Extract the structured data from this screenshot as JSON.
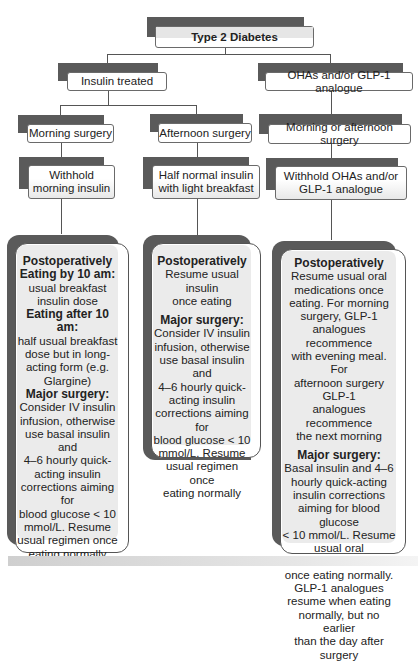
{
  "root": {
    "label": "Type 2 Diabetes"
  },
  "branches": [
    {
      "label": "Insulin treated",
      "children": [
        {
          "timing": "Morning surgery",
          "action": [
            "Withhold",
            "morning insulin"
          ],
          "postop": {
            "lines": [
              {
                "text": "Postoperatively",
                "bold": true
              },
              {
                "text": "Eating by 10 am:",
                "bold": true
              },
              {
                "text": "usual breakfast",
                "bold": false
              },
              {
                "text": "insulin dose",
                "bold": false
              },
              {
                "text": "Eating after 10 am:",
                "bold": true
              },
              {
                "text": "half usual breakfast",
                "bold": false
              },
              {
                "text": "dose but in long-",
                "bold": false
              },
              {
                "text": "acting form (e.g.",
                "bold": false
              },
              {
                "text": "Glargine)",
                "bold": false
              },
              {
                "text": "Major surgery:",
                "bold": true
              },
              {
                "text": "Consider IV insulin",
                "bold": false
              },
              {
                "text": "infusion, otherwise",
                "bold": false
              },
              {
                "text": "use basal insulin and",
                "bold": false
              },
              {
                "text": "4–6 hourly quick-",
                "bold": false
              },
              {
                "text": "acting insulin",
                "bold": false
              },
              {
                "text": "corrections aiming for",
                "bold": false
              },
              {
                "text": "blood glucose < 10",
                "bold": false
              },
              {
                "text": "mmol/L. Resume",
                "bold": false
              },
              {
                "text": "usual regimen once",
                "bold": false
              },
              {
                "text": "eating normally",
                "bold": false
              }
            ]
          }
        },
        {
          "timing": "Afternoon surgery",
          "action": [
            "Half normal insulin",
            "with light breakfast"
          ],
          "postop": {
            "lines": [
              {
                "text": "Postoperatively",
                "bold": true
              },
              {
                "text": "Resume usual insulin",
                "bold": false
              },
              {
                "text": "once eating",
                "bold": false
              },
              {
                "text": "",
                "gap": true
              },
              {
                "text": "Major surgery:",
                "bold": true
              },
              {
                "text": "Consider IV insulin",
                "bold": false
              },
              {
                "text": "infusion, otherwise",
                "bold": false
              },
              {
                "text": "use basal insulin and",
                "bold": false
              },
              {
                "text": "4–6 hourly quick-",
                "bold": false
              },
              {
                "text": "acting insulin",
                "bold": false
              },
              {
                "text": "corrections aiming for",
                "bold": false
              },
              {
                "text": "blood glucose < 10",
                "bold": false
              },
              {
                "text": "mmol/L. Resume",
                "bold": false
              },
              {
                "text": "usual regimen once",
                "bold": false
              },
              {
                "text": "eating normally",
                "bold": false
              }
            ]
          }
        }
      ]
    },
    {
      "label": "OHAs and/or GLP-1 analogue",
      "children": [
        {
          "timing": "Morning or afternoon surgery",
          "action": [
            "Withhold OHAs and/or",
            "GLP-1 analogue"
          ],
          "postop": {
            "lines": [
              {
                "text": "Postoperatively",
                "bold": true
              },
              {
                "text": "Resume usual oral",
                "bold": false
              },
              {
                "text": "medications once",
                "bold": false
              },
              {
                "text": "eating. For morning",
                "bold": false
              },
              {
                "text": "surgery, GLP-1",
                "bold": false
              },
              {
                "text": "analogues recommence",
                "bold": false
              },
              {
                "text": "with evening meal. For",
                "bold": false
              },
              {
                "text": "afternoon surgery GLP-1",
                "bold": false
              },
              {
                "text": "analogues recommence",
                "bold": false
              },
              {
                "text": "the next morning",
                "bold": false
              },
              {
                "text": "",
                "gap": true
              },
              {
                "text": "Major surgery:",
                "bold": true
              },
              {
                "text": "Basal insulin and 4–6",
                "bold": false
              },
              {
                "text": "hourly quick-acting",
                "bold": false
              },
              {
                "text": "insulin corrections",
                "bold": false
              },
              {
                "text": "aiming for blood glucose",
                "bold": false
              },
              {
                "text": "< 10 mmol/L. Resume",
                "bold": false
              },
              {
                "text": "usual oral medications",
                "bold": false
              },
              {
                "text": "once eating normally.",
                "bold": false
              },
              {
                "text": "GLP-1 analogues",
                "bold": false
              },
              {
                "text": "resume when eating",
                "bold": false
              },
              {
                "text": "normally, but no earlier",
                "bold": false
              },
              {
                "text": "than the day after",
                "bold": false
              },
              {
                "text": "surgery",
                "bold": false
              }
            ]
          }
        }
      ]
    }
  ],
  "colors": {
    "shadow": "#5a5a5a",
    "box_fill": "#ebebeb",
    "border": "#555555",
    "connector": "#555555"
  }
}
